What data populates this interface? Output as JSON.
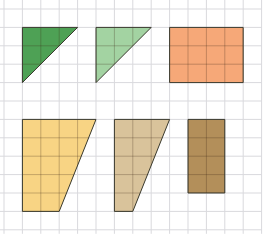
{
  "diagram": {
    "grid": {
      "origin_x": 4,
      "origin_y": 9,
      "cell": 18.4,
      "cols": 14,
      "rows": 12,
      "line_color": "#d9d9dd"
    },
    "shapes": [
      {
        "id": "dark-green-triangle",
        "type": "triangle",
        "fill": "#4ea155",
        "points": [
          [
            1,
            1
          ],
          [
            4,
            1
          ],
          [
            1,
            4
          ]
        ]
      },
      {
        "id": "light-green-triangle",
        "type": "triangle",
        "fill": "#a3d3a2",
        "points": [
          [
            5,
            1
          ],
          [
            8,
            1
          ],
          [
            5,
            4
          ]
        ]
      },
      {
        "id": "orange-rectangle",
        "type": "rectangle",
        "fill": "#f6a878",
        "points": [
          [
            9,
            1
          ],
          [
            13,
            1
          ],
          [
            13,
            4
          ],
          [
            9,
            4
          ]
        ]
      },
      {
        "id": "yellow-trapezoid",
        "type": "trapezoid",
        "fill": "#f8d484",
        "points": [
          [
            1,
            6
          ],
          [
            5,
            6
          ],
          [
            3,
            11
          ],
          [
            1,
            11
          ]
        ]
      },
      {
        "id": "tan-trapezoid",
        "type": "trapezoid",
        "fill": "#d9c39b",
        "points": [
          [
            6,
            6
          ],
          [
            9,
            6
          ],
          [
            7,
            11
          ],
          [
            6,
            11
          ]
        ]
      },
      {
        "id": "brown-rectangle",
        "type": "rectangle",
        "fill": "#b38f5a",
        "points": [
          [
            10,
            6
          ],
          [
            12,
            6
          ],
          [
            12,
            10
          ],
          [
            10,
            10
          ]
        ]
      }
    ]
  }
}
